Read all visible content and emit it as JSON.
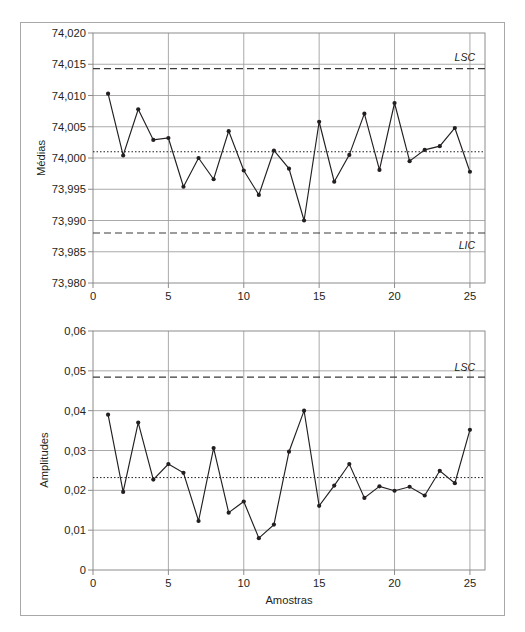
{
  "figure": {
    "frame_color": "#a8a8a8",
    "background": "#ffffff",
    "line_color": "#231f20",
    "grid_color": "#a0a0a0"
  },
  "chart_data": [
    {
      "type": "line",
      "name": "x-bar-chart",
      "title": "",
      "xlabel": "",
      "ylabel": "Médias",
      "xlim": [
        0,
        26
      ],
      "ylim": [
        73.98,
        74.02
      ],
      "xticks": [
        0,
        5,
        10,
        15,
        20,
        25
      ],
      "xtick_labels": [
        "0",
        "5",
        "10",
        "15",
        "20",
        "25"
      ],
      "yticks": [
        73.98,
        73.985,
        73.99,
        73.995,
        74.0,
        74.005,
        74.01,
        74.015,
        74.02
      ],
      "ytick_labels": [
        "73,980",
        "73,985",
        "73,990",
        "73,995",
        "74,000",
        "74,005",
        "74,010",
        "74,015",
        "74,020"
      ],
      "grid": true,
      "x": [
        1,
        2,
        3,
        4,
        5,
        6,
        7,
        8,
        9,
        10,
        11,
        12,
        13,
        14,
        15,
        16,
        17,
        18,
        19,
        20,
        21,
        22,
        23,
        24,
        25
      ],
      "values": [
        74.0103,
        74.0004,
        74.0078,
        74.0029,
        74.0032,
        73.9954,
        74.0,
        73.9966,
        74.0043,
        73.998,
        73.9941,
        74.0012,
        73.9983,
        73.99,
        74.0058,
        73.9962,
        74.0005,
        74.0071,
        73.9981,
        74.0088,
        73.9995,
        74.0013,
        74.0019,
        74.0048,
        73.9978
      ],
      "center_line": {
        "label": "LC",
        "value": 74.001,
        "style": "dotted"
      },
      "upper_limit": {
        "label": "LSC",
        "value": 74.0143,
        "style": "dashed"
      },
      "lower_limit": {
        "label": "LIC",
        "value": 73.988,
        "style": "dashed"
      }
    },
    {
      "type": "line",
      "name": "range-chart",
      "title": "",
      "xlabel": "Amostras",
      "ylabel": "Amplitudes",
      "xlim": [
        0,
        26
      ],
      "ylim": [
        0,
        0.06
      ],
      "xticks": [
        0,
        5,
        10,
        15,
        20,
        25
      ],
      "xtick_labels": [
        "0",
        "5",
        "10",
        "15",
        "20",
        "25"
      ],
      "yticks": [
        0,
        0.01,
        0.02,
        0.03,
        0.04,
        0.05,
        0.06
      ],
      "ytick_labels": [
        "0",
        "0,01",
        "0,02",
        "0,03",
        "0,04",
        "0,05",
        "0,06"
      ],
      "grid": true,
      "x": [
        1,
        2,
        3,
        4,
        5,
        6,
        7,
        8,
        9,
        10,
        11,
        12,
        13,
        14,
        15,
        16,
        17,
        18,
        19,
        20,
        21,
        22,
        23,
        24,
        25
      ],
      "values": [
        0.039,
        0.0196,
        0.037,
        0.0227,
        0.0266,
        0.0244,
        0.0123,
        0.0306,
        0.0144,
        0.0172,
        0.008,
        0.0114,
        0.0297,
        0.04,
        0.0161,
        0.0212,
        0.0266,
        0.0181,
        0.021,
        0.0199,
        0.0209,
        0.0187,
        0.0249,
        0.0218,
        0.0352
      ],
      "center_line": {
        "label": "LC",
        "value": 0.0232,
        "style": "dotted"
      },
      "upper_limit": {
        "label": "LSC",
        "value": 0.0484,
        "style": "dashed"
      },
      "lower_limit": {
        "label": "LIC",
        "value": 0.0,
        "style": "none"
      }
    }
  ],
  "labels": {
    "chart1_ylabel": "Médias",
    "chart1_lsc": "LSC",
    "chart1_lic": "LIC",
    "chart1_ytick_0": "73,980",
    "chart1_ytick_1": "73,985",
    "chart1_ytick_2": "73,990",
    "chart1_ytick_3": "73,995",
    "chart1_ytick_4": "74,000",
    "chart1_ytick_5": "74,005",
    "chart1_ytick_6": "74,010",
    "chart1_ytick_7": "74,015",
    "chart1_ytick_8": "74,020",
    "chart1_xtick_0": "0",
    "chart1_xtick_1": "5",
    "chart1_xtick_2": "10",
    "chart1_xtick_3": "15",
    "chart1_xtick_4": "20",
    "chart1_xtick_5": "25",
    "chart2_ylabel": "Amplitudes",
    "chart2_xlabel": "Amostras",
    "chart2_lsc": "LSC",
    "chart2_ytick_0": "0",
    "chart2_ytick_1": "0,01",
    "chart2_ytick_2": "0,02",
    "chart2_ytick_3": "0,03",
    "chart2_ytick_4": "0,04",
    "chart2_ytick_5": "0,05",
    "chart2_ytick_6": "0,06",
    "chart2_xtick_0": "0",
    "chart2_xtick_1": "5",
    "chart2_xtick_2": "10",
    "chart2_xtick_3": "15",
    "chart2_xtick_4": "20",
    "chart2_xtick_5": "25"
  }
}
